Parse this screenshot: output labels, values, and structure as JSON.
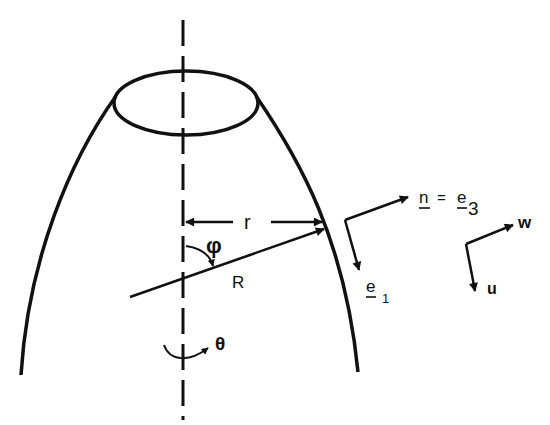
{
  "diagram": {
    "colors": {
      "ink": "#111111",
      "background": "#ffffff"
    },
    "labels": {
      "r": "r",
      "R": "R",
      "phi": "φ",
      "theta": "θ",
      "n": "n",
      "equals": "=",
      "e3": "e",
      "e3_sub": "3",
      "e1": "e",
      "e1_sub": "1",
      "w": "w",
      "u": "u"
    }
  }
}
